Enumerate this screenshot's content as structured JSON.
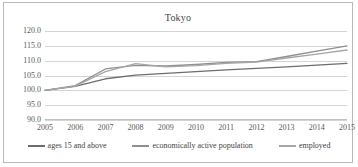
{
  "frame": {
    "border_color": "#b9b9b9"
  },
  "chart_data": {
    "type": "line",
    "title": "Tokyo",
    "xlabel": "",
    "ylabel": "",
    "grid": true,
    "legend_position": "bottom",
    "ylim": [
      90.0,
      120.0
    ],
    "yticks": [
      "90.0",
      "95.0",
      "100.0",
      "105.0",
      "110.0",
      "115.0",
      "120.0"
    ],
    "ytick_values": [
      90.0,
      95.0,
      100.0,
      105.0,
      110.0,
      115.0,
      120.0
    ],
    "categories": [
      "2005",
      "2006",
      "2007",
      "2008",
      "2009",
      "2010",
      "2011",
      "2012",
      "2013",
      "2014",
      "2015"
    ],
    "x": [
      2005,
      2006,
      2007,
      2008,
      2009,
      2010,
      2011,
      2012,
      2013,
      2014,
      2015
    ],
    "series": [
      {
        "name": "ages 15 and above",
        "color": "#6d6d6d",
        "values": [
          100.0,
          101.3,
          103.9,
          105.1,
          105.7,
          106.3,
          106.9,
          107.4,
          107.9,
          108.5,
          109.1
        ]
      },
      {
        "name": "economically active population",
        "color": "#8f8f8f",
        "values": [
          100.0,
          101.6,
          107.2,
          108.4,
          108.2,
          108.7,
          109.4,
          109.7,
          111.4,
          113.2,
          115.0
        ]
      },
      {
        "name": "employed",
        "color": "#a6a6a6",
        "values": [
          100.0,
          101.4,
          106.3,
          109.0,
          107.9,
          108.3,
          109.1,
          109.5,
          110.9,
          112.2,
          113.6
        ]
      }
    ]
  }
}
